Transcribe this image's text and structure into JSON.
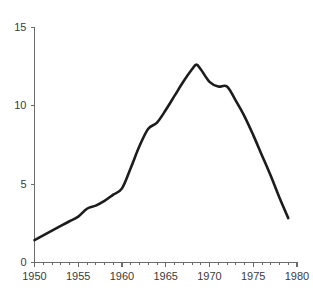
{
  "chart_data": {
    "type": "line",
    "title": "",
    "subtitle": "",
    "xlabel": "",
    "ylabel": "",
    "xlim": [
      1950,
      1980
    ],
    "ylim": [
      0,
      15
    ],
    "grid": false,
    "legend": "none",
    "x_ticks_major": [
      1950,
      1955,
      1960,
      1965,
      1970,
      1975,
      1980
    ],
    "x_tick_labels": [
      "1950",
      "1955",
      "1960",
      "1965",
      "1970",
      "1975",
      "1980"
    ],
    "x_ticks_minor_step": 1,
    "y_ticks": [
      0,
      5,
      10,
      15
    ],
    "y_tick_labels": [
      "0",
      "5",
      "10",
      "15"
    ],
    "series": [
      {
        "name": "series-1",
        "color": "#1c1c1c",
        "line_width": 2.6,
        "x": [
          1950,
          1951,
          1952,
          1953,
          1954,
          1955,
          1956,
          1957,
          1958,
          1959,
          1960,
          1961,
          1962,
          1963,
          1964,
          1965,
          1966,
          1967,
          1968,
          1968.5,
          1969,
          1970,
          1971,
          1972,
          1973,
          1974,
          1975,
          1976,
          1977,
          1978,
          1979
        ],
        "values": [
          1.4,
          1.7,
          2.0,
          2.3,
          2.6,
          2.9,
          3.4,
          3.6,
          3.9,
          4.3,
          4.7,
          6.0,
          7.4,
          8.5,
          8.9,
          9.7,
          10.6,
          11.5,
          12.3,
          12.6,
          12.3,
          11.5,
          11.2,
          11.2,
          10.3,
          9.3,
          8.1,
          6.8,
          5.5,
          4.1,
          2.8
        ]
      }
    ]
  },
  "axes": {
    "y_axis_name": "value-axis",
    "x_axis_name": "year-axis"
  }
}
